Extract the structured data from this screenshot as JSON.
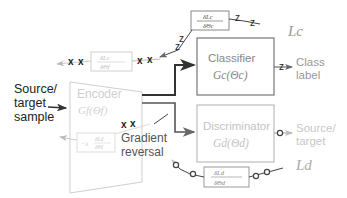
{
  "input": {
    "line1": "Source/",
    "line2": "target",
    "line3": "sample"
  },
  "encoder": {
    "title": "Encoder",
    "formula": "G_f(Θ_f)",
    "formula_text": "Gf(Θf)"
  },
  "classifier": {
    "title": "Classifier",
    "formula_text": "Gc(Θc)"
  },
  "discriminator": {
    "title": "Discriminator",
    "formula_text": "Gd(Θd)"
  },
  "outputs": {
    "class_label": {
      "line1": "Class",
      "line2": "label"
    },
    "domain_label": {
      "line1": "Source/",
      "line2": "target"
    }
  },
  "losses": {
    "classifier": "Lc",
    "discriminator": "Ld"
  },
  "gradients": {
    "classifier": {
      "numerator": "δLc",
      "denominator": "δΘc"
    },
    "encoder_from_classifier": {
      "numerator": "δLc",
      "denominator": "δΘf"
    },
    "discriminator": {
      "numerator": "δLd",
      "denominator": "δΘd"
    },
    "encoder_reversed": {
      "prefix": "−λ",
      "numerator": "δLd",
      "denominator": "δΘf"
    }
  },
  "gradient_reversal": {
    "line1": "Gradient",
    "line2": "reversal"
  },
  "markers": {
    "classifier_path": "z",
    "encoder_path": "x",
    "discriminator_path": "o"
  },
  "colors": {
    "dark": "#222222",
    "box_classifier": "#777777",
    "box_light": "#bdbdbd",
    "text_light": "#b5b5b5",
    "line": "#333333"
  }
}
